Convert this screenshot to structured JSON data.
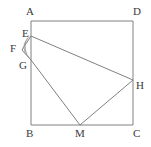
{
  "figure": {
    "kind": "geometry-diagram",
    "canvas": {
      "width": 151,
      "height": 147
    },
    "stroke_color": "#808080",
    "hatch_color": "#9a9a9a",
    "label_color": "#3a3a3a",
    "background_color": "#ffffff"
  },
  "points": [
    {
      "id": "A",
      "label": "A",
      "x": 31,
      "y": 21,
      "label_x": 26,
      "label_y": 6
    },
    {
      "id": "D",
      "label": "D",
      "x": 133,
      "y": 21,
      "label_x": 133,
      "label_y": 6
    },
    {
      "id": "B",
      "label": "B",
      "x": 31,
      "y": 125,
      "label_x": 26,
      "label_y": 128
    },
    {
      "id": "C",
      "label": "C",
      "x": 133,
      "y": 125,
      "label_x": 133,
      "label_y": 128
    },
    {
      "id": "E",
      "label": "E",
      "x": 31,
      "y": 36,
      "label_x": 22,
      "label_y": 28
    },
    {
      "id": "F",
      "label": "F",
      "x": 22,
      "y": 50,
      "label_x": 10,
      "label_y": 43
    },
    {
      "id": "G",
      "label": "G",
      "x": 31,
      "y": 60,
      "label_x": 19,
      "label_y": 60
    },
    {
      "id": "H",
      "label": "H",
      "x": 133,
      "y": 80,
      "label_x": 136,
      "label_y": 80
    },
    {
      "id": "M",
      "label": "M",
      "x": 80,
      "y": 125,
      "label_x": 75,
      "label_y": 128
    }
  ],
  "segments": [
    {
      "id": "AD",
      "from": "A",
      "to": "D",
      "x1": 31,
      "y1": 21,
      "x2": 133,
      "y2": 21
    },
    {
      "id": "DC",
      "from": "D",
      "to": "C",
      "x1": 133,
      "y1": 21,
      "x2": 133,
      "y2": 125
    },
    {
      "id": "CB",
      "from": "C",
      "to": "B",
      "x1": 133,
      "y1": 125,
      "x2": 31,
      "y2": 125
    },
    {
      "id": "BA",
      "from": "B",
      "to": "A",
      "x1": 31,
      "y1": 125,
      "x2": 31,
      "y2": 21
    },
    {
      "id": "EH",
      "from": "E",
      "to": "H",
      "x1": 31,
      "y1": 36,
      "x2": 133,
      "y2": 80
    },
    {
      "id": "GM",
      "from": "G",
      "to": "M",
      "x1": 31,
      "y1": 60,
      "x2": 80,
      "y2": 125
    },
    {
      "id": "MH",
      "from": "M",
      "to": "H",
      "x1": 80,
      "y1": 125,
      "x2": 133,
      "y2": 80
    },
    {
      "id": "EF",
      "from": "E",
      "to": "F",
      "x1": 31,
      "y1": 36,
      "x2": 22,
      "y2": 50
    },
    {
      "id": "FG",
      "from": "F",
      "to": "G",
      "x1": 22,
      "y1": 50,
      "x2": 31,
      "y2": 60
    }
  ],
  "hatched_regions": [
    {
      "id": "EFG",
      "vertices": "31,36 22,50 31,60",
      "hatch_lines": [
        {
          "x1": 29.2,
          "y1": 36.0,
          "x2": 24.0,
          "y2": 44.0
        },
        {
          "x1": 27.4,
          "y1": 38.0,
          "x2": 22.8,
          "y2": 48.6
        },
        {
          "x1": 25.6,
          "y1": 40.8,
          "x2": 24.6,
          "y2": 52.4
        },
        {
          "x1": 24.2,
          "y1": 43.6,
          "x2": 26.6,
          "y2": 55.0
        },
        {
          "x1": 23.0,
          "y1": 46.8,
          "x2": 28.6,
          "y2": 57.2
        },
        {
          "x1": 22.4,
          "y1": 50.4,
          "x2": 30.4,
          "y2": 59.2
        }
      ]
    }
  ]
}
